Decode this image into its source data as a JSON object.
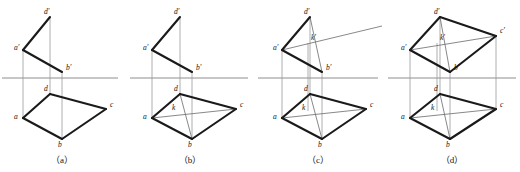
{
  "figure": {
    "width": 520,
    "height": 172,
    "background": "#ffffff",
    "colors": {
      "outline": "#1a1a1a",
      "ground_line": "#8e8e8e",
      "projector": "#9b9b9b",
      "construction": "#6a6a6a",
      "label": "#141414"
    },
    "ground_line_y": 78,
    "panels": [
      {
        "id": "a",
        "caption": "（a）",
        "caption_x": 62,
        "caption_y": 163,
        "ground_line": {
          "x1": 2,
          "y1": 78,
          "x2": 118,
          "y2": 78
        },
        "points": {
          "d_prime": {
            "x": 50,
            "y": 17,
            "label": "d′",
            "lx": 44,
            "ly": 14
          },
          "a_prime": {
            "x": 23,
            "y": 50,
            "label": "a′",
            "lx": 14,
            "ly": 50
          },
          "b_prime": {
            "x": 62,
            "y": 72,
            "label": "b′",
            "lx": 66,
            "ly": 70
          },
          "d": {
            "x": 50,
            "y": 94,
            "label": "d",
            "lx": 44,
            "ly": 91
          },
          "a": {
            "x": 23,
            "y": 118,
            "label": "a",
            "lx": 14,
            "ly": 119
          },
          "b": {
            "x": 62,
            "y": 139,
            "label": "b",
            "lx": 58,
            "ly": 147
          },
          "c": {
            "x": 106,
            "y": 109,
            "label": "c",
            "lx": 110,
            "ly": 107
          }
        },
        "heavy_polylines": [
          [
            "a_prime",
            "d_prime"
          ],
          [
            "a_prime",
            "b_prime"
          ],
          [
            "a",
            "d"
          ],
          [
            "d",
            "c"
          ],
          [
            "c",
            "b"
          ],
          [
            "b",
            "a"
          ]
        ],
        "projectors": [
          {
            "x": 23,
            "y1": 50,
            "y2": 118
          },
          {
            "x": 50,
            "y1": 17,
            "y2": 94
          },
          {
            "x": 62,
            "y1": 72,
            "y2": 139
          }
        ],
        "thin_lines": [],
        "aux_line": null
      },
      {
        "id": "b",
        "caption": "（b）",
        "caption_x": 190,
        "caption_y": 163,
        "ground_line": {
          "x1": 130,
          "y1": 78,
          "x2": 248,
          "y2": 78
        },
        "points": {
          "d_prime": {
            "x": 180,
            "y": 17,
            "label": "d′",
            "lx": 174,
            "ly": 14
          },
          "a_prime": {
            "x": 152,
            "y": 50,
            "label": "a′",
            "lx": 143,
            "ly": 50
          },
          "b_prime": {
            "x": 192,
            "y": 72,
            "label": "b′",
            "lx": 196,
            "ly": 70
          },
          "d": {
            "x": 180,
            "y": 94,
            "label": "d",
            "lx": 174,
            "ly": 91
          },
          "a": {
            "x": 152,
            "y": 118,
            "label": "a",
            "lx": 143,
            "ly": 119
          },
          "b": {
            "x": 192,
            "y": 139,
            "label": "b",
            "lx": 188,
            "ly": 147
          },
          "c": {
            "x": 236,
            "y": 109,
            "label": "c",
            "lx": 240,
            "ly": 107
          },
          "k": {
            "x": 178,
            "y": 111,
            "label": "k",
            "lx": 172,
            "ly": 110
          }
        },
        "heavy_polylines": [
          [
            "a_prime",
            "d_prime"
          ],
          [
            "a_prime",
            "b_prime"
          ],
          [
            "a",
            "d"
          ],
          [
            "d",
            "c"
          ],
          [
            "c",
            "b"
          ],
          [
            "b",
            "a"
          ]
        ],
        "projectors": [
          {
            "x": 152,
            "y1": 50,
            "y2": 118
          },
          {
            "x": 180,
            "y1": 17,
            "y2": 94
          },
          {
            "x": 192,
            "y1": 72,
            "y2": 139
          }
        ],
        "thin_lines": [
          {
            "from": "a",
            "to": "c"
          },
          {
            "from": "d",
            "to": "b"
          }
        ],
        "aux_line": null
      },
      {
        "id": "c",
        "caption": "（c）",
        "caption_x": 318,
        "caption_y": 163,
        "ground_line": {
          "x1": 258,
          "y1": 78,
          "x2": 378,
          "y2": 78
        },
        "points": {
          "d_prime": {
            "x": 310,
            "y": 17,
            "label": "d′",
            "lx": 304,
            "ly": 14
          },
          "a_prime": {
            "x": 282,
            "y": 50,
            "label": "a′",
            "lx": 273,
            "ly": 50
          },
          "b_prime": {
            "x": 322,
            "y": 72,
            "label": "b′",
            "lx": 326,
            "ly": 70
          },
          "k_prime": {
            "x": 308,
            "y": 43,
            "label": "k′",
            "lx": 311,
            "ly": 40
          },
          "d": {
            "x": 310,
            "y": 94,
            "label": "d",
            "lx": 304,
            "ly": 91
          },
          "a": {
            "x": 282,
            "y": 118,
            "label": "a",
            "lx": 273,
            "ly": 119
          },
          "b": {
            "x": 322,
            "y": 139,
            "label": "b",
            "lx": 318,
            "ly": 147
          },
          "c": {
            "x": 366,
            "y": 109,
            "label": "c",
            "lx": 370,
            "ly": 107
          },
          "k": {
            "x": 308,
            "y": 111,
            "label": "k",
            "lx": 302,
            "ly": 110
          }
        },
        "heavy_polylines": [
          [
            "a_prime",
            "d_prime"
          ],
          [
            "a_prime",
            "b_prime"
          ],
          [
            "a",
            "d"
          ],
          [
            "d",
            "c"
          ],
          [
            "c",
            "b"
          ],
          [
            "b",
            "a"
          ]
        ],
        "projectors": [
          {
            "x": 282,
            "y1": 50,
            "y2": 118
          },
          {
            "x": 310,
            "y1": 17,
            "y2": 94
          },
          {
            "x": 322,
            "y1": 72,
            "y2": 139
          },
          {
            "x": 308,
            "y1": 43,
            "y2": 111
          }
        ],
        "thin_lines": [
          {
            "from": "a",
            "to": "c"
          },
          {
            "from": "d",
            "to": "b"
          },
          {
            "from": "d_prime",
            "to": "b_prime"
          }
        ],
        "aux_line": {
          "x1": 282,
          "y1": 50,
          "x2": 382,
          "y2": 26
        }
      },
      {
        "id": "d",
        "caption": "（d）",
        "caption_x": 452,
        "caption_y": 163,
        "ground_line": {
          "x1": 388,
          "y1": 78,
          "x2": 516,
          "y2": 78
        },
        "points": {
          "d_prime": {
            "x": 440,
            "y": 17,
            "label": "d′",
            "lx": 434,
            "ly": 14
          },
          "a_prime": {
            "x": 410,
            "y": 50,
            "label": "a′",
            "lx": 401,
            "ly": 50
          },
          "b_prime": {
            "x": 450,
            "y": 72,
            "label": "b′",
            "lx": 454,
            "ly": 70
          },
          "c_prime": {
            "x": 496,
            "y": 36,
            "label": "c′",
            "lx": 500,
            "ly": 33
          },
          "k_prime": {
            "x": 437,
            "y": 43,
            "label": "k′",
            "lx": 440,
            "ly": 40
          },
          "d": {
            "x": 440,
            "y": 94,
            "label": "d",
            "lx": 434,
            "ly": 91
          },
          "a": {
            "x": 410,
            "y": 118,
            "label": "a",
            "lx": 401,
            "ly": 119
          },
          "b": {
            "x": 450,
            "y": 139,
            "label": "b",
            "lx": 446,
            "ly": 147
          },
          "c": {
            "x": 496,
            "y": 109,
            "label": "c",
            "lx": 500,
            "ly": 107
          },
          "k": {
            "x": 437,
            "y": 111,
            "label": "k",
            "lx": 431,
            "ly": 110
          }
        },
        "heavy_polylines": [
          [
            "a_prime",
            "d_prime"
          ],
          [
            "d_prime",
            "c_prime"
          ],
          [
            "c_prime",
            "b_prime"
          ],
          [
            "b_prime",
            "a_prime"
          ],
          [
            "a",
            "d"
          ],
          [
            "d",
            "c"
          ],
          [
            "c",
            "b"
          ],
          [
            "b",
            "a"
          ]
        ],
        "projectors": [
          {
            "x": 410,
            "y1": 50,
            "y2": 118
          },
          {
            "x": 440,
            "y1": 17,
            "y2": 94
          },
          {
            "x": 450,
            "y1": 72,
            "y2": 139
          },
          {
            "x": 437,
            "y1": 43,
            "y2": 111
          },
          {
            "x": 496,
            "y1": 36,
            "y2": 109
          }
        ],
        "thin_lines": [
          {
            "from": "a",
            "to": "c"
          },
          {
            "from": "d",
            "to": "b"
          },
          {
            "from": "a_prime",
            "to": "c_prime"
          },
          {
            "from": "d_prime",
            "to": "b_prime"
          }
        ],
        "aux_line": null
      }
    ]
  }
}
